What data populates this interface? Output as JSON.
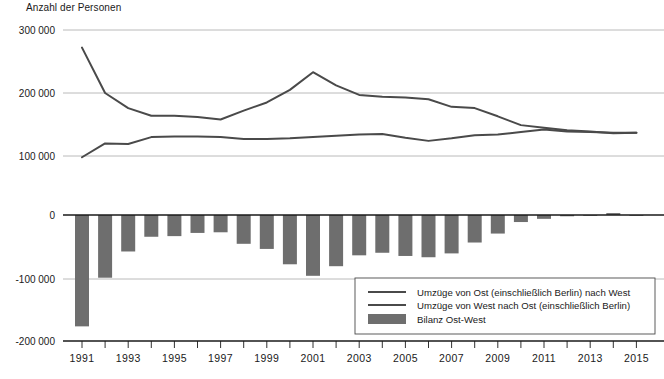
{
  "chart_data": {
    "type": "line",
    "title": "",
    "ylabel": "Anzahl der Personen",
    "xlabel": "",
    "grid": true,
    "legend_position": "bottom-right",
    "panels": [
      {
        "name": "upper-panel",
        "type": "line",
        "ylim": [
          100000,
          300000
        ],
        "yticks": [
          100000,
          200000,
          300000
        ],
        "ytick_labels": [
          "100 000",
          "200 000",
          "300 000"
        ]
      },
      {
        "name": "lower-panel",
        "type": "bar",
        "ylim": [
          -200000,
          20000
        ],
        "yticks": [
          0,
          -100000,
          -200000
        ],
        "ytick_labels": [
          "0",
          "-100 000",
          "-200 000"
        ]
      }
    ],
    "x": [
      1991,
      1992,
      1993,
      1994,
      1995,
      1996,
      1997,
      1998,
      1999,
      2000,
      2001,
      2002,
      2003,
      2004,
      2005,
      2006,
      2007,
      2008,
      2009,
      2010,
      2011,
      2012,
      2013,
      2014,
      2015
    ],
    "xtick_labels": [
      "1991",
      "1993",
      "1995",
      "1997",
      "1999",
      "2001",
      "2003",
      "2005",
      "2007",
      "2009",
      "2011",
      "2013",
      "2015"
    ],
    "series": [
      {
        "name": "Umzüge von Ost (einschließlich Berlin) nach West",
        "key": "ost_nach_west",
        "type": "line",
        "color": "#4a4a4a",
        "values": [
          272000,
          200000,
          176000,
          164000,
          164000,
          162000,
          158000,
          172000,
          185000,
          205000,
          233000,
          212000,
          197000,
          194000,
          193000,
          190000,
          178000,
          176000,
          163000,
          149000,
          145000,
          141000,
          139000,
          136000,
          137000
        ]
      },
      {
        "name": "Umzüge von West nach Ost (einschließlich Berlin)",
        "key": "west_nach_ost",
        "type": "line",
        "color": "#4a4a4a",
        "values": [
          98000,
          120000,
          119000,
          130000,
          131000,
          131000,
          130000,
          127000,
          127000,
          128000,
          130000,
          132000,
          134000,
          135000,
          129000,
          124000,
          128000,
          133000,
          134000,
          138000,
          142000,
          139000,
          138000,
          137000,
          137000
        ]
      },
      {
        "name": "Bilanz Ost-West",
        "key": "bilanz_ost_west",
        "type": "bar",
        "color": "#6e6e6e",
        "values": [
          -174000,
          -98000,
          -57000,
          -34000,
          -33000,
          -28000,
          -27000,
          -45000,
          -53000,
          -77000,
          -95000,
          -80000,
          -63000,
          -59000,
          -64000,
          -66000,
          -60000,
          -43000,
          -29000,
          -11000,
          -6000,
          -2000,
          -1000,
          3000,
          -1000
        ]
      }
    ],
    "legend": [
      {
        "marker": "line",
        "label": "Umzüge von Ost (einschließlich Berlin) nach West"
      },
      {
        "marker": "line",
        "label": "Umzüge von West nach Ost (einschließlich Berlin)"
      },
      {
        "marker": "swatch",
        "label": "Bilanz Ost-West"
      }
    ],
    "colors": {
      "line": "#4a4a4a",
      "bar": "#6e6e6e",
      "grid": "#a8a8a8",
      "axis": "#1a1a1a",
      "background": "#ffffff"
    }
  }
}
